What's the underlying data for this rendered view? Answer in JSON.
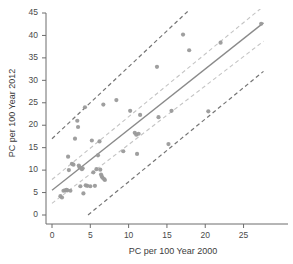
{
  "chart_data": {
    "type": "scatter",
    "title": "",
    "xlabel": "PC per 100 Year 2000",
    "ylabel": "PC per 100 Year 2012",
    "xlim": [
      0,
      30.8
    ],
    "ylim": [
      0,
      45
    ],
    "xticks": [
      0,
      5,
      10,
      15,
      20,
      25
    ],
    "yticks": [
      0,
      5,
      10,
      15,
      20,
      25,
      30,
      35,
      40,
      45
    ],
    "xtick_labels": [
      "0",
      "5",
      "10",
      "15",
      "20",
      "25"
    ],
    "ytick_labels": [
      "0",
      "5",
      "10",
      "15",
      "20",
      "25",
      "30",
      "35",
      "40",
      "45"
    ],
    "grid": false,
    "legend": "none",
    "marker": {
      "shape": "circle",
      "color": "#9a9a9a",
      "size": 4.2,
      "opacity": 0.95
    },
    "points": [
      {
        "x": 1.1,
        "y": 4.2
      },
      {
        "x": 1.3,
        "y": 3.9
      },
      {
        "x": 1.5,
        "y": 5.4
      },
      {
        "x": 1.7,
        "y": 5.5
      },
      {
        "x": 1.9,
        "y": 5.6
      },
      {
        "x": 2.0,
        "y": 5.5
      },
      {
        "x": 2.1,
        "y": 13.0
      },
      {
        "x": 2.2,
        "y": 10.0
      },
      {
        "x": 2.4,
        "y": 5.4
      },
      {
        "x": 2.6,
        "y": 11.4
      },
      {
        "x": 2.8,
        "y": 11.2
      },
      {
        "x": 3.0,
        "y": 17.0
      },
      {
        "x": 3.3,
        "y": 21.0
      },
      {
        "x": 3.4,
        "y": 19.6
      },
      {
        "x": 3.5,
        "y": 11.0
      },
      {
        "x": 3.6,
        "y": 10.6
      },
      {
        "x": 3.7,
        "y": 6.4
      },
      {
        "x": 3.9,
        "y": 10.2
      },
      {
        "x": 4.0,
        "y": 10.4
      },
      {
        "x": 4.1,
        "y": 4.8
      },
      {
        "x": 4.3,
        "y": 24.0
      },
      {
        "x": 4.4,
        "y": 6.6
      },
      {
        "x": 4.6,
        "y": 6.5
      },
      {
        "x": 5.0,
        "y": 6.4
      },
      {
        "x": 5.2,
        "y": 16.6
      },
      {
        "x": 5.4,
        "y": 9.5
      },
      {
        "x": 5.6,
        "y": 6.5
      },
      {
        "x": 5.8,
        "y": 10.2
      },
      {
        "x": 6.0,
        "y": 13.3
      },
      {
        "x": 6.2,
        "y": 16.4
      },
      {
        "x": 6.3,
        "y": 10.1
      },
      {
        "x": 6.4,
        "y": 9.0
      },
      {
        "x": 6.5,
        "y": 8.6
      },
      {
        "x": 6.6,
        "y": 8.3
      },
      {
        "x": 6.7,
        "y": 24.6
      },
      {
        "x": 6.8,
        "y": 8.0
      },
      {
        "x": 6.9,
        "y": 7.8
      },
      {
        "x": 8.4,
        "y": 25.6
      },
      {
        "x": 9.3,
        "y": 14.2
      },
      {
        "x": 10.2,
        "y": 23.2
      },
      {
        "x": 10.8,
        "y": 18.3
      },
      {
        "x": 11.0,
        "y": 17.9
      },
      {
        "x": 11.1,
        "y": 13.6
      },
      {
        "x": 11.3,
        "y": 18.1
      },
      {
        "x": 11.5,
        "y": 22.3
      },
      {
        "x": 13.7,
        "y": 33.0
      },
      {
        "x": 13.9,
        "y": 21.8
      },
      {
        "x": 15.2,
        "y": 15.8
      },
      {
        "x": 15.6,
        "y": 23.2
      },
      {
        "x": 17.1,
        "y": 40.2
      },
      {
        "x": 17.9,
        "y": 36.7
      },
      {
        "x": 20.4,
        "y": 23.1
      },
      {
        "x": 22.0,
        "y": 38.4
      },
      {
        "x": 27.3,
        "y": 42.6
      }
    ],
    "lines": [
      {
        "name": "regression-line",
        "style": "solid",
        "color": "#8a8a8a",
        "width": 1.3,
        "x0": 0.0,
        "y0": 5.5,
        "x1": 27.6,
        "y1": 42.8
      },
      {
        "name": "confidence-band-upper",
        "style": "dashed",
        "color": "#c4c4c4",
        "width": 1.1,
        "x0": 0.0,
        "y0": 7.9,
        "x1": 27.6,
        "y1": 46.5
      },
      {
        "name": "confidence-band-lower",
        "style": "dashed",
        "color": "#c4c4c4",
        "width": 1.1,
        "x0": 0.0,
        "y0": 2.6,
        "x1": 27.6,
        "y1": 38.7
      },
      {
        "name": "prediction-band-upper",
        "style": "dashed",
        "color": "#757575",
        "width": 1.2,
        "x0": 0.0,
        "y0": 17.0,
        "x1": 17.8,
        "y1": 45.5
      },
      {
        "name": "prediction-band-lower",
        "style": "dashed",
        "color": "#757575",
        "width": 1.2,
        "x0": 4.7,
        "y0": 0.0,
        "x1": 27.6,
        "y1": 32.0
      }
    ],
    "axis_color": "#6d6d6d"
  }
}
